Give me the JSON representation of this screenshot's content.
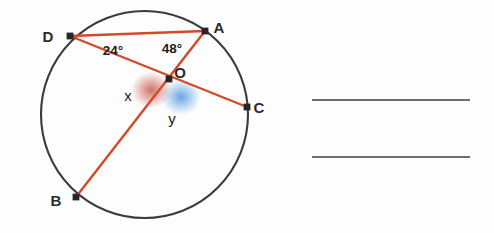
{
  "figure": {
    "circle": {
      "center_x": 144.5,
      "center_y": 114.5,
      "radius": 103.5,
      "stroke_color": "#3b3b3b"
    },
    "chord_color": "#d24a28",
    "point_marker_color": "#262626",
    "points": [
      {
        "id": "A",
        "label": "A",
        "x": 205,
        "y": 31,
        "label_x": 219,
        "label_y": 33
      },
      {
        "id": "B",
        "label": "B",
        "x": 76,
        "y": 197,
        "label_x": 56,
        "label_y": 206
      },
      {
        "id": "C",
        "label": "C",
        "x": 247,
        "y": 107,
        "label_x": 259,
        "label_y": 113
      },
      {
        "id": "D",
        "label": "D",
        "x": 70,
        "y": 36,
        "label_x": 48,
        "label_y": 42
      },
      {
        "id": "O",
        "label": "O",
        "x": 169,
        "y": 79,
        "label_x": 180,
        "label_y": 78
      }
    ],
    "chords": [
      {
        "id": "DA",
        "from": "D",
        "to": "A"
      },
      {
        "id": "DC",
        "from": "D",
        "to": "C"
      },
      {
        "id": "AB",
        "from": "A",
        "to": "B"
      }
    ],
    "angle_labels": [
      {
        "id": "angle-adO",
        "text": "24°",
        "x": 113,
        "y": 55
      },
      {
        "id": "angle-daO",
        "text": "48°",
        "x": 172,
        "y": 53
      }
    ],
    "variable_labels": [
      {
        "id": "angle-x",
        "text": "x",
        "x": 128,
        "y": 101
      },
      {
        "id": "angle-y",
        "text": "y",
        "x": 172,
        "y": 124
      }
    ],
    "shaded_angles": [
      {
        "id": "shade-x",
        "color": "#c0392b",
        "cx": 151,
        "cy": 90,
        "rx": 19,
        "ry": 17
      },
      {
        "id": "shade-y",
        "color": "#2980d9",
        "cx": 181,
        "cy": 97,
        "rx": 19,
        "ry": 17
      }
    ]
  },
  "answer_lines": [
    {
      "id": "answer-line-1",
      "x1": 312,
      "y1": 100,
      "x2": 470,
      "y2": 100
    },
    {
      "id": "answer-line-2",
      "x1": 312,
      "y1": 157,
      "x2": 470,
      "y2": 157
    }
  ],
  "answer_line_color": "#6f6f6f"
}
